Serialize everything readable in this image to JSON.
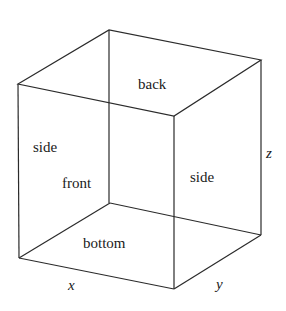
{
  "figure": {
    "type": "cube-diagram",
    "width": 286,
    "height": 311,
    "background_color": "#ffffff",
    "line_color": "#2b2b2b",
    "line_width": 1.2,
    "text_color": "#1a1a1a"
  },
  "labels": {
    "faces": [
      {
        "id": "back",
        "text": "back",
        "style": "upright"
      },
      {
        "id": "side-l",
        "text": "side",
        "style": "upright"
      },
      {
        "id": "side-r",
        "text": "side",
        "style": "upright"
      },
      {
        "id": "front",
        "text": "front",
        "style": "upright"
      },
      {
        "id": "bottom",
        "text": "bottom",
        "style": "upright"
      }
    ],
    "axes": [
      {
        "id": "x",
        "text": "x",
        "style": "italic"
      },
      {
        "id": "y",
        "text": "y",
        "style": "italic"
      },
      {
        "id": "z",
        "text": "z",
        "style": "italic"
      }
    ]
  },
  "geometry": {
    "vertices": {
      "front_top_left": [
        18,
        84
      ],
      "front_bottom_left": [
        19,
        258
      ],
      "back_top_left": [
        109,
        30
      ],
      "inner_top": [
        174,
        116
      ],
      "back_top_right": [
        261,
        60
      ],
      "back_bottom_right": [
        261,
        235
      ],
      "front_bottom": [
        174,
        289
      ],
      "inner_bottom": [
        110,
        203
      ]
    },
    "edges": [
      [
        "front_top_left",
        "back_top_left"
      ],
      [
        "back_top_left",
        "back_top_right"
      ],
      [
        "back_top_right",
        "inner_top"
      ],
      [
        "inner_top",
        "front_top_left"
      ],
      [
        "front_top_left",
        "front_bottom_left"
      ],
      [
        "back_top_left",
        "inner_top"
      ],
      [
        "back_top_right",
        "back_bottom_right"
      ],
      [
        "inner_top",
        "front_bottom"
      ],
      [
        "front_bottom_left",
        "inner_bottom"
      ],
      [
        "inner_bottom",
        "inner_top"
      ],
      [
        "inner_bottom",
        "back_bottom_right"
      ],
      [
        "front_bottom_left",
        "front_bottom"
      ],
      [
        "front_bottom",
        "back_bottom_right"
      ]
    ]
  }
}
